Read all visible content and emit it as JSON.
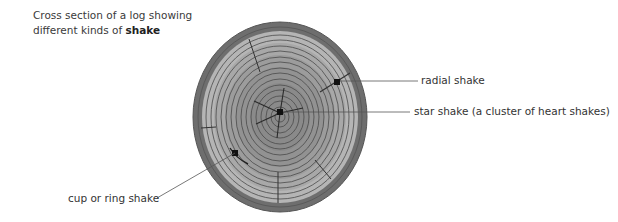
{
  "title": {
    "line1": "Cross section of a log showing",
    "line2_prefix": "different kinds of ",
    "line2_bold": "shake"
  },
  "labels": {
    "radial": "radial shake",
    "star": "star shake (a cluster of heart shakes)",
    "cup": "cup or ring shake"
  },
  "colors": {
    "bark": "#6e6e6e",
    "bark_edge": "#555555",
    "sapwood": "#b4b4b4",
    "heartwood": "#8c8c8c",
    "ring_line": "#4a4a4a",
    "leader": "#555555"
  }
}
